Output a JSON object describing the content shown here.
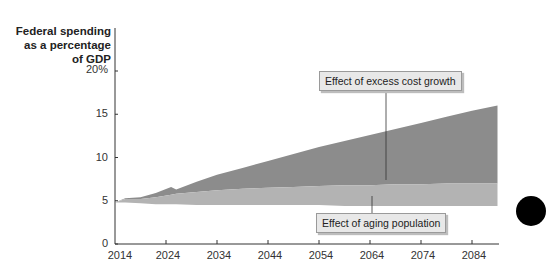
{
  "chart_data": {
    "type": "area",
    "title": "",
    "ylabel": "Federal spending as a percentage of GDP",
    "xlabel": "",
    "ylim": [
      0,
      20
    ],
    "xlim": [
      2014,
      2089
    ],
    "y_ticks": [
      "0",
      "5",
      "10",
      "15",
      "20%"
    ],
    "x_ticks": [
      "2014",
      "2024",
      "2034",
      "2044",
      "2054",
      "2064",
      "2074",
      "2084"
    ],
    "grid": false,
    "legend": "callouts",
    "x": [
      2014,
      2016,
      2019,
      2022,
      2025,
      2026,
      2030,
      2034,
      2039,
      2044,
      2049,
      2054,
      2059,
      2064,
      2069,
      2074,
      2079,
      2084,
      2089
    ],
    "series": [
      {
        "name": "Baseline spending",
        "values": [
          4.8,
          4.8,
          4.7,
          4.6,
          4.6,
          4.6,
          4.5,
          4.5,
          4.5,
          4.5,
          4.5,
          4.5,
          4.4,
          4.4,
          4.4,
          4.4,
          4.4,
          4.4,
          4.4
        ]
      },
      {
        "name": "Effect of aging population",
        "values": [
          4.8,
          5.2,
          5.2,
          5.4,
          5.7,
          5.8,
          6.0,
          6.2,
          6.4,
          6.5,
          6.6,
          6.7,
          6.8,
          6.8,
          6.9,
          6.9,
          7.0,
          7.0,
          7.0
        ]
      },
      {
        "name": "Effect of excess cost growth",
        "values": [
          4.8,
          5.3,
          5.4,
          5.9,
          6.6,
          6.3,
          7.2,
          8.0,
          8.8,
          9.6,
          10.4,
          11.2,
          11.9,
          12.6,
          13.3,
          14.0,
          14.7,
          15.4,
          16.0
        ]
      }
    ],
    "annotations": [
      {
        "text": "Effect of excess cost growth",
        "points_to": {
          "x": 2067,
          "y": 7.5
        }
      },
      {
        "text": "Effect of aging population",
        "points_to": {
          "x": 2064,
          "y": 5.5
        }
      }
    ]
  },
  "axis": {
    "ytitle_lines": [
      "Federal spending",
      "as a percentage",
      "of GDP"
    ],
    "yticks": [
      "20%",
      "15",
      "10",
      "5",
      "0"
    ],
    "xticks": [
      "2014",
      "2024",
      "2034",
      "2044",
      "2054",
      "2064",
      "2074",
      "2084"
    ]
  },
  "callouts": {
    "cost_growth": "Effect of excess cost growth",
    "aging": "Effect of aging population"
  },
  "colors": {
    "cost_growth": "#8c8c8c",
    "aging": "#b3b3b3",
    "callout_bg": "#e8e8e8",
    "axis": "#333333"
  }
}
